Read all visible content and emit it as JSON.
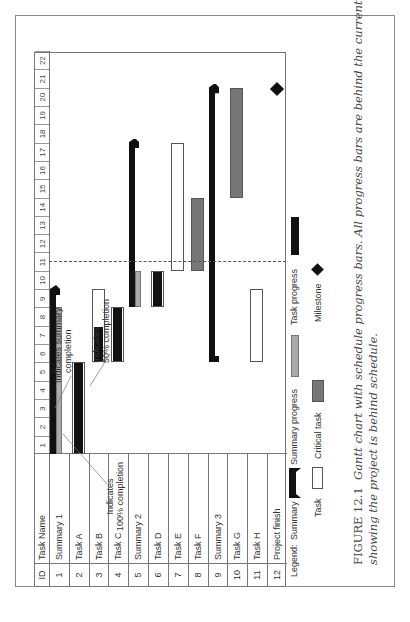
{
  "chart_data": {
    "type": "gantt",
    "title": "Gantt chart with schedule progress bars",
    "columns": [
      "ID",
      "Task Name"
    ],
    "timeline_ticks": [
      1,
      2,
      3,
      4,
      5,
      6,
      7,
      8,
      9,
      10,
      11,
      12,
      13,
      14,
      15,
      16,
      17,
      18,
      19,
      20,
      21,
      22
    ],
    "current_date": 11,
    "rows": [
      {
        "id": "1",
        "name": "Summary 1",
        "type": "summary",
        "start": 1,
        "end": 9,
        "progress_end": 8
      },
      {
        "id": "2",
        "name": "Task A",
        "type": "task",
        "start": 1,
        "end": 5,
        "progress_end": 5
      },
      {
        "id": "3",
        "name": "Task B",
        "type": "task",
        "start": 6,
        "end": 9,
        "progress_end": 7
      },
      {
        "id": "4",
        "name": "Task C",
        "type": "task",
        "start": 6,
        "end": 8,
        "progress_end": 8
      },
      {
        "id": "5",
        "name": "Summary 2",
        "type": "summary",
        "start": 9,
        "end": 17,
        "progress_end": 10
      },
      {
        "id": "6",
        "name": "Task D",
        "type": "task",
        "start": 9,
        "end": 10,
        "progress_end": 10
      },
      {
        "id": "7",
        "name": "Task E",
        "type": "task",
        "start": 11,
        "end": 17,
        "progress_end": null
      },
      {
        "id": "8",
        "name": "Task F",
        "type": "critical",
        "start": 11,
        "end": 14,
        "progress_end": null
      },
      {
        "id": "9",
        "name": "Summary 3",
        "type": "summary",
        "start": 6,
        "end": 20,
        "progress_end": null
      },
      {
        "id": "10",
        "name": "Task G",
        "type": "critical",
        "start": 15,
        "end": 20,
        "progress_end": null
      },
      {
        "id": "11",
        "name": "Task H",
        "type": "task",
        "start": 6,
        "end": 9,
        "progress_end": null
      },
      {
        "id": "12",
        "name": "Project finish",
        "type": "milestone",
        "start": 20,
        "end": 20,
        "progress_end": null
      }
    ],
    "annotations": [
      "Indicates summary completion",
      "Indicates 50% completion",
      "Indicates 100% completion"
    ],
    "legend": [
      "Summary",
      "Summary progress",
      "Task progress",
      "Task",
      "Critical task",
      "Milestone"
    ]
  },
  "header": {
    "id": "ID",
    "name": "Task Name"
  },
  "annotations": {
    "summary": [
      "Indicates summary",
      "completion"
    ],
    "fifty": [
      "Indicates",
      "50% completion"
    ],
    "hundred": [
      "Indicates",
      "100% completion"
    ]
  },
  "legend": {
    "title": "Legend:",
    "summary": "Summary",
    "summary_progress": "Summary progress",
    "task_progress": "Task progress",
    "task": "Task",
    "critical": "Critical task",
    "milestone": "Milestone"
  },
  "caption": {
    "figure": "FIGURE 12.1",
    "line1": "Gantt chart with schedule progress bars. All progress bars are behind the current date.",
    "line2": "showing the project is behind schedule."
  },
  "colors": {
    "summary": "#111111",
    "summary_progress": "#aaaaaa",
    "critical": "#777777",
    "task": "#ffffff"
  }
}
